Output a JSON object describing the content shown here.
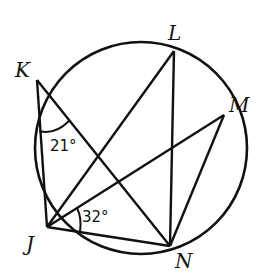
{
  "diagram": {
    "type": "inscribed-angles-circle",
    "points": {
      "K": {
        "label": "K"
      },
      "L": {
        "label": "L"
      },
      "M": {
        "label": "M"
      },
      "J": {
        "label": "J"
      },
      "N": {
        "label": "N"
      }
    },
    "segments": [
      "KJ",
      "KN",
      "JL",
      "JM",
      "JN",
      "LN",
      "MN"
    ],
    "angles": [
      {
        "vertex": "K",
        "between": [
          "J",
          "N"
        ],
        "label": "21°"
      },
      {
        "vertex": "J",
        "between": [
          "M",
          "N"
        ],
        "label": "32°"
      }
    ],
    "stroke_color": "#111111"
  }
}
